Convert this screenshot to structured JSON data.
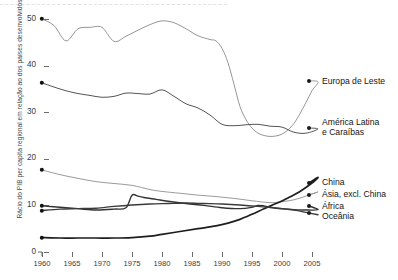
{
  "figure": {
    "top_cut_text": "– – – – – – – – – – – – – – – – – – – – – – – – – – – – – – – – – – – – – – – – – – – –"
  },
  "chart_data": {
    "type": "line",
    "title": "",
    "xlabel": "",
    "ylabel": "Rácio do PIB per capita regional em relação ao dos países desenvolvidos (%)",
    "xlim": [
      1960,
      2007
    ],
    "ylim": [
      0,
      52
    ],
    "yticks": [
      0,
      10,
      20,
      30,
      40,
      50
    ],
    "xticks": [
      1960,
      1965,
      1970,
      1975,
      1980,
      1985,
      1990,
      1995,
      2000,
      2005
    ],
    "grid": false,
    "legend_position": "right-inline",
    "series": [
      {
        "name": "Europa de Leste",
        "color": "#8a8a8a",
        "width": 0.9,
        "label_x": 322,
        "label_y": 83,
        "marker_x": 309,
        "marker_y": 81,
        "start_marker": true,
        "x": [
          1960,
          1962,
          1964,
          1966,
          1968,
          1970,
          1972,
          1974,
          1976,
          1978,
          1980,
          1982,
          1984,
          1986,
          1988,
          1989,
          1990,
          1991,
          1992,
          1993,
          1994,
          1995,
          1996,
          1997,
          1998,
          1999,
          2000,
          2001,
          2002,
          2003,
          2004,
          2005,
          2006
        ],
        "y": [
          50.0,
          48.6,
          45.3,
          47.9,
          48.2,
          48.2,
          45.2,
          46.3,
          47.6,
          48.8,
          49.6,
          49.2,
          47.9,
          46.4,
          45.6,
          45.3,
          43.7,
          40.6,
          36.0,
          31.2,
          28.4,
          26.6,
          25.5,
          25.0,
          24.8,
          24.9,
          25.3,
          26.2,
          27.6,
          29.7,
          32.1,
          34.6,
          36.5
        ]
      },
      {
        "name": "América Latina e Caraíbas",
        "color": "#555555",
        "width": 1.0,
        "label_x": 322,
        "label_y": 124,
        "marker_x": 309,
        "marker_y": 128,
        "start_marker": true,
        "x": [
          1960,
          1962,
          1964,
          1966,
          1968,
          1970,
          1972,
          1974,
          1976,
          1978,
          1980,
          1982,
          1984,
          1986,
          1988,
          1990,
          1992,
          1994,
          1996,
          1998,
          2000,
          2002,
          2004,
          2006
        ],
        "y": [
          36.3,
          35.4,
          34.6,
          34.0,
          33.6,
          33.2,
          33.4,
          34.1,
          34.0,
          33.9,
          34.8,
          33.4,
          31.8,
          30.9,
          29.4,
          27.4,
          27.1,
          27.3,
          27.4,
          27.0,
          26.8,
          25.7,
          25.5,
          26.4
        ]
      },
      {
        "name": "Ásia, excl. China",
        "color": "#8f8f8f",
        "width": 0.9,
        "label_x": 322,
        "label_y": 196,
        "marker_x": 309,
        "marker_y": 195,
        "start_marker": true,
        "x": [
          1960,
          1963,
          1966,
          1969,
          1972,
          1975,
          1978,
          1980,
          1983,
          1986,
          1989,
          1992,
          1995,
          1998,
          2000,
          2002,
          2004,
          2006
        ],
        "y": [
          17.6,
          16.6,
          15.8,
          15.1,
          14.7,
          14.3,
          13.4,
          13.0,
          12.6,
          12.2,
          11.9,
          11.5,
          11.0,
          10.6,
          10.8,
          11.2,
          12.0,
          12.9
        ]
      },
      {
        "name": "China",
        "color": "#1e1e1e",
        "width": 1.7,
        "label_x": 322,
        "label_y": 184,
        "marker_x": 309,
        "marker_y": 183,
        "start_marker": true,
        "x": [
          1960,
          1963,
          1966,
          1969,
          1972,
          1975,
          1978,
          1980,
          1983,
          1986,
          1989,
          1991,
          1993,
          1995,
          1997,
          1999,
          2001,
          2003,
          2005,
          2006
        ],
        "y": [
          3.1,
          3.0,
          3.0,
          3.0,
          3.0,
          3.1,
          3.4,
          3.8,
          4.4,
          5.0,
          5.6,
          6.2,
          7.0,
          8.1,
          9.3,
          10.4,
          11.6,
          13.0,
          14.8,
          16.0
        ]
      },
      {
        "name": "África",
        "color": "#333333",
        "width": 1.4,
        "label_x": 322,
        "label_y": 208,
        "marker_x": 309,
        "marker_y": 206,
        "start_marker": true,
        "x": [
          1960,
          1963,
          1966,
          1969,
          1972,
          1974,
          1975,
          1976,
          1977,
          1979,
          1981,
          1984,
          1987,
          1990,
          1993,
          1995,
          1996,
          1997,
          1998,
          2000,
          2002,
          2004,
          2006
        ],
        "y": [
          9.9,
          9.6,
          9.3,
          9.0,
          9.2,
          9.5,
          12.2,
          12.0,
          11.7,
          11.3,
          10.9,
          10.4,
          10.0,
          9.5,
          9.3,
          9.6,
          10.0,
          9.9,
          9.6,
          9.3,
          9.1,
          9.0,
          9.1
        ]
      },
      {
        "name": "Oceânia",
        "color": "#3a3a3a",
        "width": 1.4,
        "label_x": 322,
        "label_y": 218,
        "marker_x": 309,
        "marker_y": 213,
        "start_marker": true,
        "x": [
          1960,
          1963,
          1966,
          1969,
          1972,
          1975,
          1978,
          1981,
          1984,
          1987,
          1990,
          1993,
          1996,
          1999,
          2002,
          2004,
          2006
        ],
        "y": [
          8.9,
          9.2,
          9.3,
          9.4,
          9.8,
          10.1,
          10.3,
          10.4,
          10.5,
          10.4,
          10.3,
          10.1,
          9.8,
          9.4,
          9.0,
          8.5,
          8.0
        ]
      }
    ]
  }
}
